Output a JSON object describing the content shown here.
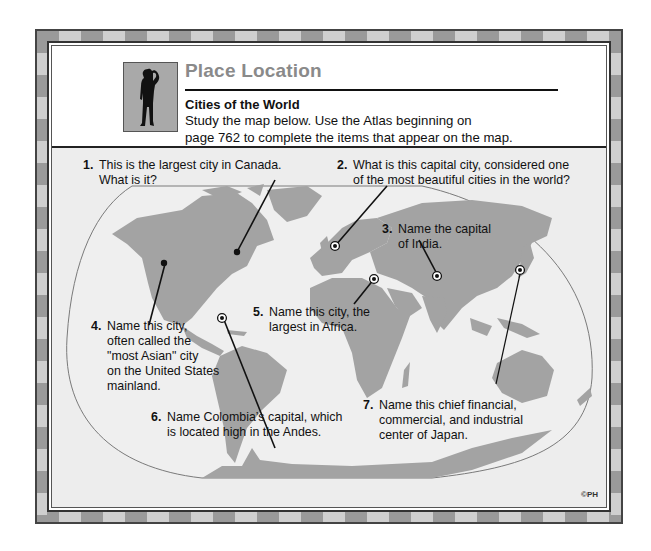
{
  "header": {
    "title": "Place Location",
    "subtitle": "Cities of the World",
    "instructions_line1": "Study the map below.  Use the Atlas beginning on",
    "instructions_line2": "page 762 to complete the items that appear on the map.",
    "icon": "person-silhouette-icon"
  },
  "colors": {
    "title": "#8a8a8a",
    "land": "#a3a3a3",
    "ocean": "#ededed",
    "frame": "#9a9a9a"
  },
  "questions": [
    {
      "number": "1.",
      "line1": "This is the largest city in Canada.",
      "line2": "What is it?",
      "line3": "",
      "line4": "",
      "line5": ""
    },
    {
      "number": "2.",
      "line1": "What is this capital city, considered one",
      "line2": "of the most beautiful cities in the world?",
      "line3": "",
      "line4": "",
      "line5": ""
    },
    {
      "number": "3.",
      "line1": "Name the capital",
      "line2": "of India.",
      "line3": "",
      "line4": "",
      "line5": ""
    },
    {
      "number": "4.",
      "line1": "Name this city,",
      "line2": "often called the",
      "line3": "\"most Asian\" city",
      "line4": "on the United States",
      "line5": "mainland."
    },
    {
      "number": "5.",
      "line1": "Name this city, the",
      "line2": "largest in Africa.",
      "line3": "",
      "line4": "",
      "line5": ""
    },
    {
      "number": "6.",
      "line1": "Name Colombia’s capital, which",
      "line2": "is located high in the Andes.",
      "line3": "",
      "line4": "",
      "line5": ""
    },
    {
      "number": "7.",
      "line1": "Name this chief financial,",
      "line2": "commercial, and industrial",
      "line3": "center of Japan.",
      "line4": "",
      "line5": ""
    }
  ],
  "markers": [
    {
      "id": "toronto",
      "style": "dot"
    },
    {
      "id": "paris",
      "style": "capital"
    },
    {
      "id": "new-delhi",
      "style": "capital"
    },
    {
      "id": "san-francisco",
      "style": "dot"
    },
    {
      "id": "cairo",
      "style": "capital"
    },
    {
      "id": "bogota",
      "style": "capital"
    },
    {
      "id": "tokyo",
      "style": "capital"
    }
  ],
  "copyright": "©PH"
}
